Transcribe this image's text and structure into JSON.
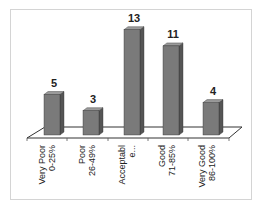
{
  "chart_data": {
    "type": "bar",
    "style": "3d-column",
    "title": "",
    "xlabel": "",
    "ylabel": "",
    "categories": [
      [
        "Very Poor",
        "0-25%"
      ],
      [
        "Poor",
        "26-49%"
      ],
      [
        "Acceptabl",
        "e..."
      ],
      [
        "Good",
        "71-85%"
      ],
      [
        "Very Good",
        "86-100%"
      ]
    ],
    "values": [
      5,
      3,
      13,
      11,
      4
    ],
    "data_labels": [
      "5",
      "3",
      "13",
      "11",
      "4"
    ],
    "grid": false,
    "legend": null,
    "ylim": [
      0,
      14
    ],
    "colors": {
      "bar_front": "#7a7a7a",
      "bar_side": "#555555",
      "bar_top": "#9a9a9a",
      "floor": "#ffffff",
      "outline": "#333333"
    }
  }
}
